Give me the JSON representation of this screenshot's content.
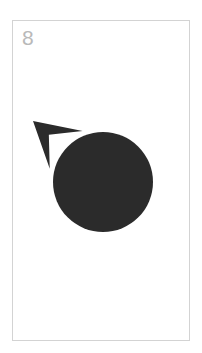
{
  "canvas": {
    "width": 202,
    "height": 353,
    "background_color": "#ffffff"
  },
  "card": {
    "name": "symbol-card",
    "x": 12,
    "y": 20,
    "width": 178,
    "height": 321,
    "background_color": "#ffffff",
    "border_color": "#d3d3d3",
    "border_width": 1
  },
  "index_label": {
    "text": "8",
    "color": "#b9b9b9",
    "font_size_px": 21
  },
  "symbol": {
    "name": "mars-symbol",
    "unicode": "♂",
    "description": "Mars / male symbol: solid filled disc with a dart-style arrow projecting from the upper-left at roughly 45 degrees",
    "fill_color": "#2b2b2b",
    "circle": {
      "center_x": 90,
      "center_y": 161,
      "radius": 50
    },
    "arrow": {
      "tip_x": 20,
      "tip_y": 100,
      "direction": "up-left",
      "angle_degrees": 315,
      "shaft_width": 9,
      "head_style": "concave-dart"
    }
  }
}
